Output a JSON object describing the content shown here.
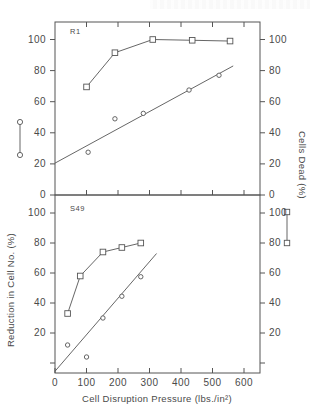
{
  "figure": {
    "background": "#ffffff",
    "ink_color": "#555555",
    "axis_titles": {
      "x": "Cell Disruption Pressure (lbs./in²)",
      "y_left": "Reduction in Cell No. (%)",
      "y_right": "Cells Dead (%)"
    },
    "legend": {
      "left_symbol_name": "open-circle",
      "right_symbol_name": "open-square",
      "left_series_axis": "Reduction in Cell No. (%)",
      "right_series_axis": "Cells Dead (%)"
    }
  },
  "chart_data": [
    {
      "type": "scatter",
      "panel": "top",
      "title": "",
      "panel_label": "R1",
      "xlabel": "",
      "ylabel": "Reduction in Cell No. (%)",
      "y2label": "Cells Dead (%)",
      "xlim": [
        0,
        650
      ],
      "ylim": [
        0,
        108
      ],
      "y2lim": [
        0,
        108
      ],
      "xticks": [
        0,
        100,
        200,
        300,
        400,
        500,
        600
      ],
      "yticks": [
        0,
        20,
        40,
        60,
        80,
        100
      ],
      "y2ticks": [
        0,
        20,
        40,
        60,
        80,
        100
      ],
      "grid": false,
      "legend_position": "outside-left-and-right",
      "series": [
        {
          "name": "Cells Dead (%)",
          "marker": "open-square",
          "connected": true,
          "axis": "right",
          "x": [
            100,
            190,
            310,
            435,
            555
          ],
          "values": [
            69.5,
            91.5,
            100,
            99.5,
            99
          ]
        },
        {
          "name": "Reduction in Cell No. (%)",
          "marker": "open-circle",
          "connected": false,
          "fit_line": true,
          "fit_from": [
            0,
            20.5
          ],
          "fit_to": [
            565,
            83
          ],
          "axis": "left",
          "x": [
            105,
            190,
            280,
            425,
            520
          ],
          "values": [
            27.5,
            49,
            52.5,
            67.5,
            77
          ]
        }
      ]
    },
    {
      "type": "scatter",
      "panel": "bottom",
      "title": "",
      "panel_label": "S49",
      "xlabel": "Cell Disruption Pressure (lbs./in²)",
      "ylabel": "Reduction in Cell No. (%)",
      "y2label": "Cells Dead (%)",
      "xlim": [
        0,
        650
      ],
      "ylim": [
        0,
        108
      ],
      "y2lim": [
        0,
        108
      ],
      "xticks": [
        0,
        100,
        200,
        300,
        400,
        500,
        600
      ],
      "yticks": [
        20,
        40,
        60,
        80,
        100
      ],
      "y2ticks": [
        20,
        40,
        60,
        80,
        100
      ],
      "grid": false,
      "legend_position": "outside-left-and-right",
      "series": [
        {
          "name": "Cells Dead (%)",
          "marker": "open-square",
          "connected": true,
          "axis": "right",
          "x": [
            40,
            80,
            152,
            212,
            272
          ],
          "values": [
            53,
            78,
            94,
            97,
            100
          ]
        },
        {
          "name": "Reduction in Cell No. (%)",
          "marker": "open-circle",
          "connected": false,
          "fit_line": true,
          "fit_from": [
            0,
            14.5
          ],
          "fit_to": [
            322,
            93
          ],
          "axis": "left",
          "x": [
            40,
            100,
            152,
            212,
            272
          ],
          "values": [
            32,
            24,
            50,
            64.5,
            77.5
          ]
        }
      ]
    }
  ]
}
